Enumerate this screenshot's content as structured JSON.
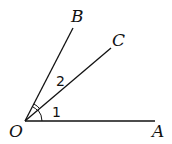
{
  "diagram": {
    "title": "",
    "points": {
      "O": {
        "label": "O"
      },
      "A": {
        "label": "A"
      },
      "B": {
        "label": "B"
      },
      "C": {
        "label": "C"
      }
    },
    "rays": [
      "OA",
      "OB",
      "OC"
    ],
    "angles": [
      {
        "label": "1",
        "between": [
          "OA",
          "OC"
        ],
        "mark": "single-arc"
      },
      {
        "label": "2",
        "between": [
          "OC",
          "OB"
        ],
        "mark": "double-arc"
      }
    ],
    "stroke_color": "#111111"
  }
}
